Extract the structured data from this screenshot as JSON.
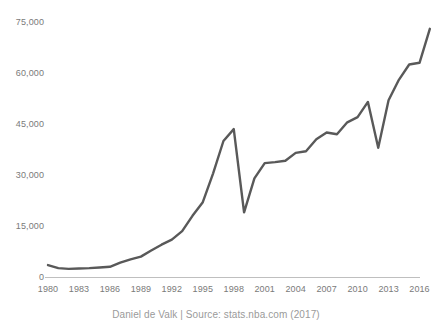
{
  "caption": "Daniel de Valk | Source: stats.nba.com (2017)",
  "colors": {
    "line": "#595959",
    "axis": "#bfbfbf",
    "tick_text": "#7a7a7a",
    "caption_text": "#9a9a9a",
    "background": "#ffffff"
  },
  "chart_data": {
    "type": "line",
    "title": "",
    "subtitle": "",
    "xlabel": "",
    "ylabel": "",
    "xlim": [
      1980,
      2017
    ],
    "ylim": [
      0,
      75000
    ],
    "grid": false,
    "legend": "none",
    "ytick_labels": [
      "0",
      "15,000",
      "30,000",
      "45,000",
      "60,000",
      "75,000"
    ],
    "ytick_values": [
      0,
      15000,
      30000,
      45000,
      60000,
      75000
    ],
    "xtick_labels": [
      "1980",
      "1983",
      "1986",
      "1989",
      "1992",
      "1995",
      "1998",
      "2001",
      "2004",
      "2007",
      "2010",
      "2013",
      "2016"
    ],
    "xtick_values": [
      1980,
      1983,
      1986,
      1989,
      1992,
      1995,
      1998,
      2001,
      2004,
      2007,
      2010,
      2013,
      2016
    ],
    "series": [
      {
        "name": "",
        "x": [
          1980,
          1981,
          1982,
          1983,
          1984,
          1985,
          1986,
          1987,
          1988,
          1989,
          1990,
          1991,
          1992,
          1993,
          1994,
          1995,
          1996,
          1997,
          1998,
          1999,
          2000,
          2001,
          2002,
          2003,
          2004,
          2005,
          2006,
          2007,
          2008,
          2009,
          2010,
          2011,
          2012,
          2013,
          2014,
          2015,
          2016,
          2017
        ],
        "values": [
          3500,
          2600,
          2400,
          2500,
          2600,
          2800,
          3000,
          4200,
          5200,
          6000,
          7800,
          9500,
          11000,
          13500,
          18000,
          22000,
          30500,
          40000,
          43500,
          19000,
          29000,
          33500,
          33800,
          34200,
          36500,
          37000,
          40500,
          42500,
          42000,
          45500,
          47000,
          51500,
          38000,
          52000,
          58000,
          62500,
          63000,
          73000
        ]
      }
    ]
  }
}
